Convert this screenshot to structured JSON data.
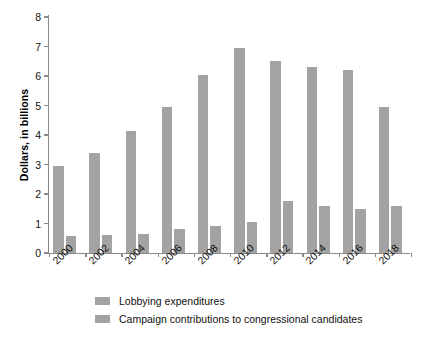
{
  "chart_data": {
    "type": "bar",
    "title": "",
    "subtitle": "",
    "xlabel": "",
    "ylabel": "Dollars, in billions",
    "categories": [
      "2000",
      "2002",
      "2004",
      "2006",
      "2008",
      "2010",
      "2012",
      "2014",
      "2016",
      "2018"
    ],
    "series": [
      {
        "name": "Lobbying expenditures",
        "color": "#a3a3a3",
        "values": [
          2.95,
          3.4,
          4.15,
          4.95,
          6.05,
          6.95,
          6.5,
          6.3,
          6.2,
          4.95
        ]
      },
      {
        "name": "Campaign contributions to congressional candidates",
        "color": "#a3a3a3",
        "values": [
          0.58,
          0.6,
          0.65,
          0.8,
          0.92,
          1.05,
          1.75,
          1.6,
          1.5,
          1.58
        ]
      }
    ],
    "ylim": [
      0,
      8
    ],
    "y_ticks": [
      0,
      1,
      2,
      3,
      4,
      5,
      6,
      7,
      8
    ],
    "y_tick_labels": [
      "0",
      "1",
      "2",
      "3",
      "4",
      "5",
      "6",
      "7",
      "8"
    ],
    "grid": false,
    "legend_position": "bottom",
    "x_label_rotation": -45,
    "axis_color": "#8a8a8a",
    "bar_color": "#a3a3a3"
  },
  "legend": {
    "items": [
      {
        "label": "Lobbying expenditures"
      },
      {
        "label": "Campaign contributions to congressional candidates"
      }
    ]
  }
}
